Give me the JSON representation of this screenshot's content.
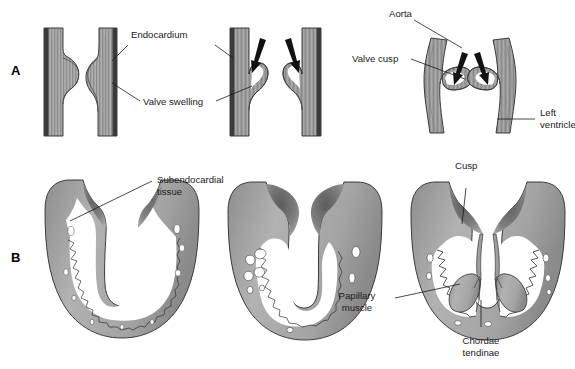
{
  "figure": {
    "background_color": "#ffffff",
    "width": 575,
    "height": 369
  },
  "palette": {
    "tissue_mid": "#9a9a9a",
    "tissue_light": "#bcbcbc",
    "tissue_dark": "#6e6e6e",
    "endocardium_dark": "#3b3b3b",
    "outline": "#2b2b2b",
    "lumen_white": "#ffffff",
    "text": "#1a1a1a",
    "arrow_black": "#111111"
  },
  "panels": [
    {
      "id": "A",
      "letter": "A",
      "caption": "Semilunar (aortic) valve formation",
      "stages": [
        {
          "id": "a1",
          "name": "stage-1-endocardial-tube",
          "description": "straight endocardial tube with small valve swelling"
        },
        {
          "id": "a2",
          "name": "stage-2-valve-swelling",
          "description": "tube with enlarged valve swelling"
        },
        {
          "id": "a3",
          "name": "stage-3-excavation",
          "description": "paired tubes with excavating cusps and blood-flow arrows"
        },
        {
          "id": "a4",
          "name": "stage-4-aortic-valve",
          "description": "mature aortic valve cusps at aorta and left ventricle junction"
        }
      ],
      "labels": [
        {
          "id": "endocardium",
          "text": "Endocardium",
          "lines": [
            "Endocardium"
          ]
        },
        {
          "id": "valve-swelling",
          "text": "Valve swelling",
          "lines": [
            "Valve swelling"
          ]
        },
        {
          "id": "aorta",
          "text": "Aorta",
          "lines": [
            "Aorta"
          ]
        },
        {
          "id": "valve-cusp",
          "text": "Valve cusp",
          "lines": [
            "Valve cusp"
          ]
        },
        {
          "id": "left-ventricle",
          "text": "Left ventricle",
          "lines": [
            "Left",
            "ventricle"
          ]
        }
      ]
    },
    {
      "id": "B",
      "letter": "B",
      "caption": "Atrioventricular (mitral) valve formation",
      "stages": [
        {
          "id": "b1",
          "name": "stage-1-trabeculated-ventricle",
          "description": "ventricle with trabeculated subendocardial tissue"
        },
        {
          "id": "b2",
          "name": "stage-2-cusp-swellings",
          "description": "ventricle with thickening cusp swellings and excavation"
        },
        {
          "id": "b3",
          "name": "stage-3-mature-av-valve",
          "description": "mature cusps with chordae tendinae and papillary muscles"
        }
      ],
      "labels": [
        {
          "id": "subendocardial-tissue",
          "text": "Subendocardial tissue",
          "lines": [
            "Subendocardial",
            "tissue"
          ]
        },
        {
          "id": "cusp",
          "text": "Cusp",
          "lines": [
            "Cusp"
          ]
        },
        {
          "id": "papillary-muscle",
          "text": "Papillary muscle",
          "lines": [
            "Papillary",
            "muscle"
          ]
        },
        {
          "id": "chordae-tendinae",
          "text": "Chordae tendinae",
          "lines": [
            "Chordae",
            "tendinae"
          ]
        }
      ]
    }
  ],
  "arrows": [
    {
      "id": "arrow-a3-left",
      "meaning": "blood-flow-arrow"
    },
    {
      "id": "arrow-a3-right",
      "meaning": "blood-flow-arrow"
    },
    {
      "id": "arrow-a4-left",
      "meaning": "blood-flow-arrow"
    },
    {
      "id": "arrow-a4-right",
      "meaning": "blood-flow-arrow"
    }
  ]
}
